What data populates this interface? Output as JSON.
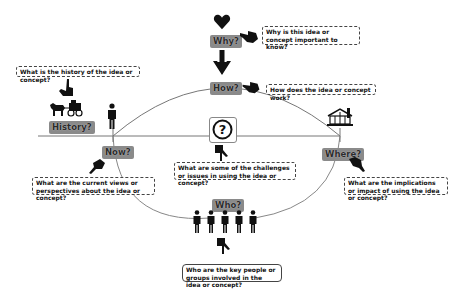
{
  "diagram": {
    "type": "concept-inquiry-map",
    "center_symbol": "?",
    "labels": {
      "why": "Why?",
      "how": "How?",
      "history": "History?",
      "now": "Now?",
      "where": "Where?",
      "who": "Who?"
    },
    "questions": {
      "why": "Why is this idea or concept important to know?",
      "how": "How does the idea or concept work?",
      "history": "What is the history of the idea or concept?",
      "now": "What are the current views or perspectives about the idea or concept?",
      "challenges": "What are some of the challenges or issues in using the idea or concept?",
      "where": "What are the implications or impact of using the idea or concept?",
      "who": "Who are the key people or groups involved in the idea or concept?"
    },
    "icons": {
      "why": "heart-icon",
      "how": "arrow-down-icon",
      "history": "horse-carriage-icon",
      "now": "person-icon",
      "where": "house-icon",
      "who": "group-of-people-icon",
      "center": "question-mark-icon",
      "pointer": "pointing-hand-icon"
    },
    "colors": {
      "tag_bg": "#8a8a8a",
      "line": "#777777",
      "icon": "#111111"
    }
  }
}
